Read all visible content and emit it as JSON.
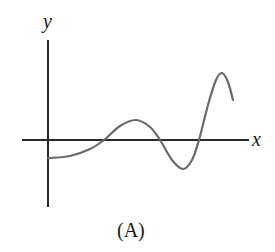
{
  "figure": {
    "caption": "(A)",
    "axes": {
      "x_label": "x",
      "y_label": "y"
    },
    "colors": {
      "axis": "#2a2a2a",
      "curve": "#6a6a6a",
      "background": "#ffffff"
    }
  },
  "chart_data": {
    "type": "line",
    "title": "",
    "xlabel": "x",
    "ylabel": "y",
    "grid": false,
    "legend": "none",
    "points_px": [
      {
        "x": 48,
        "y": 158
      },
      {
        "x": 70,
        "y": 156
      },
      {
        "x": 90,
        "y": 149
      },
      {
        "x": 104,
        "y": 140
      },
      {
        "x": 120,
        "y": 126
      },
      {
        "x": 136,
        "y": 120
      },
      {
        "x": 150,
        "y": 127
      },
      {
        "x": 160,
        "y": 140
      },
      {
        "x": 172,
        "y": 160
      },
      {
        "x": 183,
        "y": 169
      },
      {
        "x": 192,
        "y": 160
      },
      {
        "x": 199,
        "y": 140
      },
      {
        "x": 208,
        "y": 105
      },
      {
        "x": 216,
        "y": 80
      },
      {
        "x": 222,
        "y": 73
      },
      {
        "x": 228,
        "y": 82
      },
      {
        "x": 233,
        "y": 100
      }
    ],
    "axis_px": {
      "origin": {
        "x": 48,
        "y": 140
      },
      "x_axis": {
        "from": 22,
        "to": 249
      },
      "y_axis": {
        "from": 40,
        "to": 207
      }
    },
    "zero_crossings_px": [
      104,
      160,
      199
    ],
    "extrema_px": [
      {
        "kind": "start-min",
        "x": 48,
        "y": 158
      },
      {
        "kind": "local-max",
        "x": 136,
        "y": 120
      },
      {
        "kind": "local-min",
        "x": 183,
        "y": 169
      },
      {
        "kind": "local-max",
        "x": 222,
        "y": 73
      }
    ]
  }
}
